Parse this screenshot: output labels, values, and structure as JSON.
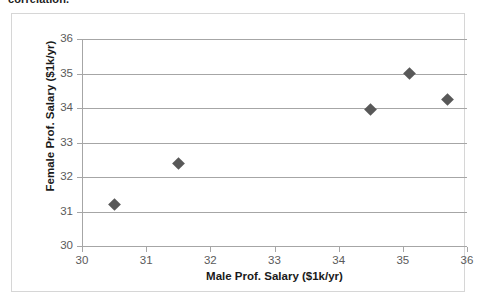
{
  "caption": {
    "text": "correlation."
  },
  "chart_data": {
    "type": "scatter",
    "title": "",
    "xlabel": "Male Prof. Salary ($1k/yr)",
    "ylabel": "Female Prof. Salary ($1k/yr)",
    "xlim": [
      30,
      36
    ],
    "ylim": [
      30,
      36
    ],
    "xticks": [
      "30",
      "31",
      "32",
      "33",
      "34",
      "35",
      "36"
    ],
    "yticks": [
      "30",
      "31",
      "32",
      "33",
      "34",
      "35",
      "36"
    ],
    "xtick_values": [
      30,
      31,
      32,
      33,
      34,
      35,
      36
    ],
    "ytick_values": [
      30,
      31,
      32,
      33,
      34,
      35,
      36
    ],
    "grid": "horizontal",
    "legend": "none",
    "marker": "diamond",
    "marker_color": "#585858",
    "gridline_color": "#a6a6a6",
    "points": [
      {
        "x": 30.5,
        "y": 31.2
      },
      {
        "x": 31.5,
        "y": 32.4
      },
      {
        "x": 34.5,
        "y": 33.95
      },
      {
        "x": 35.1,
        "y": 35.0
      },
      {
        "x": 35.7,
        "y": 34.25
      }
    ]
  }
}
